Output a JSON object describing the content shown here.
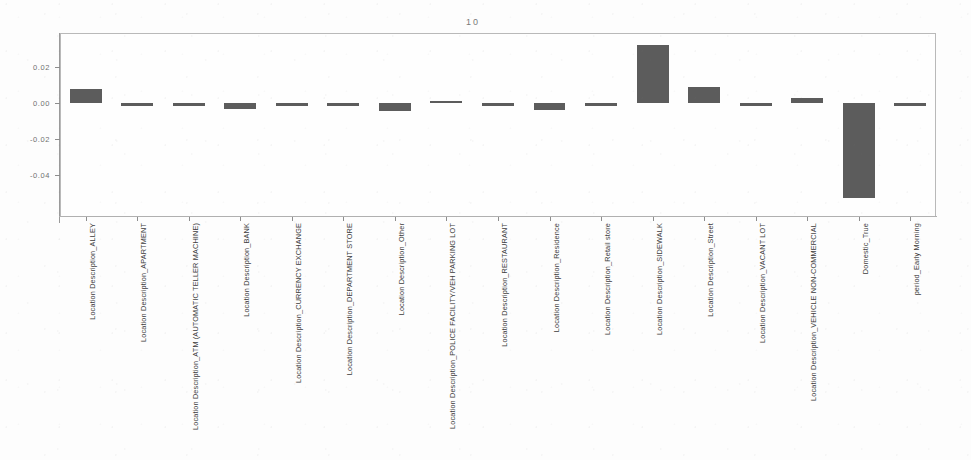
{
  "chart_data": {
    "type": "bar",
    "title": "10",
    "xlabel": "",
    "ylabel": "",
    "ylim": [
      -0.058,
      0.037
    ],
    "yticks": [
      0.02,
      0.0,
      -0.02,
      -0.04
    ],
    "ytick_labels": [
      "0.02",
      "0.00",
      "-0.02",
      "-0.04"
    ],
    "grid": false,
    "legend": null,
    "bar_color": "#5c5c5c",
    "categories": [
      "Location Description_ALLEY",
      "Location Description_APARTMENT",
      "Location Description_ATM (AUTOMATIC TELLER MACHINE)",
      "Location Description_BANK",
      "Location Description_CURRENCY EXCHANGE",
      "Location Description_DEPARTMENT STORE",
      "Location Description_Other",
      "Location Description_POLICE FACILITY/VEH PARKING LOT",
      "Location Description_RESTAURANT",
      "Location Description_Residence",
      "Location Description_Retail store",
      "Location Description_SIDEWALK",
      "Location Description_Street",
      "Location Description_VACANT LOT",
      "Location Description_VEHICLE NON-COMMERCIAL",
      "Domestic_True",
      "period_Early Morning"
    ],
    "values": [
      0.008,
      -0.0012,
      -0.0012,
      -0.0032,
      -0.0012,
      -0.0012,
      -0.0044,
      0.0012,
      -0.0012,
      -0.004,
      -0.001,
      0.0322,
      0.009,
      -0.001,
      0.0028,
      -0.0528,
      -0.001
    ]
  }
}
